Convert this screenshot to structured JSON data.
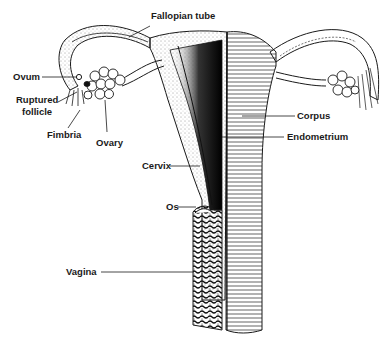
{
  "figure": {
    "colors": {
      "ink": "#1a1a1a",
      "background": "#ffffff"
    }
  },
  "labels": {
    "fallopian_tube": "Fallopian tube",
    "ovum": "Ovum",
    "ruptured_follicle_1": "Ruptured",
    "ruptured_follicle_2": "follicle",
    "fimbria": "Fimbria",
    "ovary": "Ovary",
    "corpus": "Corpus",
    "endometrium": "Endometrium",
    "cervix": "Cervix",
    "os": "Os",
    "vagina": "Vagina"
  }
}
